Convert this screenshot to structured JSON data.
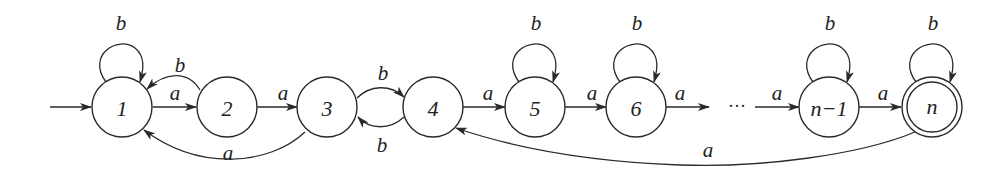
{
  "diagram": {
    "type": "finite-automaton",
    "colors": {
      "stroke": "#2a2a2a",
      "text": "#222222",
      "background": "#ffffff"
    },
    "start_state": "1",
    "accepting_states": [
      "n"
    ],
    "states": [
      {
        "id": "1",
        "label": "1"
      },
      {
        "id": "2",
        "label": "2"
      },
      {
        "id": "3",
        "label": "3"
      },
      {
        "id": "4",
        "label": "4"
      },
      {
        "id": "5",
        "label": "5"
      },
      {
        "id": "6",
        "label": "6"
      },
      {
        "id": "n-1",
        "label": "n−1"
      },
      {
        "id": "n",
        "label": "n"
      }
    ],
    "ellipsis": "···",
    "edge_labels": {
      "self_1": "b",
      "e_2_1": "b",
      "e_1_2": "a",
      "e_2_3": "a",
      "e_3_1": "a",
      "e_3_4": "b",
      "e_4_3": "b",
      "e_4_5": "a",
      "self_5": "b",
      "e_5_6": "a",
      "self_6": "b",
      "e_6_dots": "a",
      "e_dots_n1": "a",
      "self_n1": "b",
      "e_n1_n": "a",
      "self_n": "b",
      "e_n_4": "a"
    },
    "transitions": [
      {
        "from": "1",
        "to": "1",
        "symbol": "b"
      },
      {
        "from": "1",
        "to": "2",
        "symbol": "a"
      },
      {
        "from": "2",
        "to": "1",
        "symbol": "b"
      },
      {
        "from": "2",
        "to": "3",
        "symbol": "a"
      },
      {
        "from": "3",
        "to": "1",
        "symbol": "a"
      },
      {
        "from": "3",
        "to": "4",
        "symbol": "b"
      },
      {
        "from": "4",
        "to": "3",
        "symbol": "b"
      },
      {
        "from": "4",
        "to": "5",
        "symbol": "a"
      },
      {
        "from": "5",
        "to": "5",
        "symbol": "b"
      },
      {
        "from": "5",
        "to": "6",
        "symbol": "a"
      },
      {
        "from": "6",
        "to": "6",
        "symbol": "b"
      },
      {
        "from": "6",
        "to": "...",
        "symbol": "a"
      },
      {
        "from": "...",
        "to": "n-1",
        "symbol": "a"
      },
      {
        "from": "n-1",
        "to": "n-1",
        "symbol": "b"
      },
      {
        "from": "n-1",
        "to": "n",
        "symbol": "a"
      },
      {
        "from": "n",
        "to": "n",
        "symbol": "b"
      },
      {
        "from": "n",
        "to": "4",
        "symbol": "a"
      }
    ]
  }
}
